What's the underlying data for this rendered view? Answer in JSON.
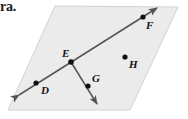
{
  "page": {
    "width": 188,
    "height": 119,
    "background": "#ffffff",
    "fragment_text": "ra."
  },
  "diagram": {
    "type": "geometry-plane-with-line-and-ray",
    "plane": {
      "name": "plane-parallelogram",
      "fill": "#ebebeb",
      "stroke": "#d2d2d2",
      "corners": [
        {
          "x": 55,
          "y": 6
        },
        {
          "x": 178,
          "y": 7
        },
        {
          "x": 130,
          "y": 110
        },
        {
          "x": 8,
          "y": 110
        }
      ]
    },
    "line_color": "#545454",
    "point_color": "#101010",
    "line_df": {
      "label": "line-DF",
      "from": {
        "x": 19,
        "y": 95
      },
      "to": {
        "x": 157,
        "y": 8
      },
      "double_arrow": true
    },
    "ray_eg": {
      "label": "ray-EG",
      "from": {
        "x": 71,
        "y": 62
      },
      "to": {
        "x": 97,
        "y": 104
      },
      "arrow": true
    },
    "points": [
      {
        "id": "D",
        "label": "D",
        "x": 36,
        "y": 83,
        "label_x": 41,
        "label_y": 94
      },
      {
        "id": "E",
        "label": "E",
        "x": 71,
        "y": 62,
        "label_x": 62,
        "label_y": 57
      },
      {
        "id": "F",
        "label": "F",
        "x": 143,
        "y": 17,
        "label_x": 146,
        "label_y": 29
      },
      {
        "id": "G",
        "label": "G",
        "x": 88,
        "y": 86,
        "label_x": 92,
        "label_y": 82
      },
      {
        "id": "H",
        "label": "H",
        "x": 125,
        "y": 57,
        "label_x": 129,
        "label_y": 68
      }
    ]
  }
}
